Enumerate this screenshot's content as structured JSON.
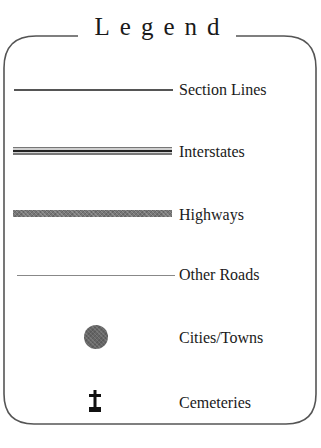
{
  "legend": {
    "title": "Legend",
    "items": [
      {
        "label": "Section Lines",
        "symbol": "thin-solid-line"
      },
      {
        "label": "Interstates",
        "symbol": "triple-line"
      },
      {
        "label": "Highways",
        "symbol": "thick-gray-line"
      },
      {
        "label": "Other Roads",
        "symbol": "thin-light-line"
      },
      {
        "label": "Cities/Towns",
        "symbol": "filled-circle"
      },
      {
        "label": "Cemeteries",
        "symbol": "cross-headstone"
      }
    ]
  },
  "colors": {
    "frame": "#555555",
    "text": "#1a1a1a",
    "city_dot": "#666666",
    "cemetery": "#111111"
  }
}
